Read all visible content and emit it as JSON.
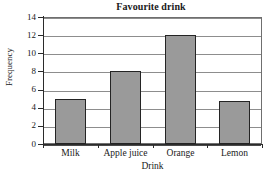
{
  "chart_data": {
    "type": "bar",
    "title": "Favourite drink",
    "xlabel": "Drink",
    "ylabel": "Frequency",
    "categories": [
      "Milk",
      "Apple juice",
      "Orange",
      "Lemon"
    ],
    "values": [
      5,
      8,
      12,
      4.7
    ],
    "ylim": [
      0,
      14
    ],
    "ytick_labels": [
      "0",
      "2",
      "4",
      "6",
      "8",
      "10",
      "12",
      "14"
    ],
    "ytick_values": [
      0,
      2,
      4,
      6,
      8,
      10,
      12,
      14
    ],
    "grid": true,
    "legend": "none",
    "bar_fill_color": "#9a9a9a",
    "bar_edge_color": "#242424",
    "axis_color": "#2b2b2b",
    "grid_color": "#8d8d8d",
    "background_color": "#ffffff"
  }
}
